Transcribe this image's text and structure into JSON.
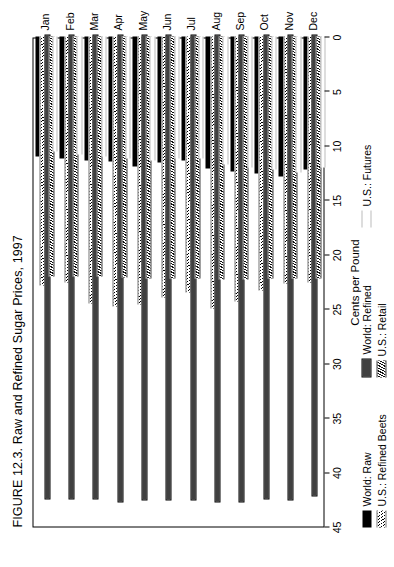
{
  "figure": {
    "title": "FIGURE 12.3. Raw and Refined Sugar Prices, 1997"
  },
  "axes": {
    "value_axis_title": "Cents per Pound",
    "value_ticks": [
      0,
      5,
      10,
      15,
      20,
      25,
      30,
      35,
      40,
      45
    ],
    "value_min": 0,
    "value_max": 45,
    "category_axis_title": ""
  },
  "legend": {
    "items": [
      {
        "label": "World: Raw",
        "pattern": "solid-black"
      },
      {
        "label": "World: Refined",
        "pattern": "checkerboard"
      },
      {
        "label": "U.S.: Futures",
        "pattern": "stipple-dots"
      },
      {
        "label": "U.S.: Refined Beets",
        "pattern": "light-diagonal-hatch"
      },
      {
        "label": "U.S.: Retail",
        "pattern": "dense-chevron-hatch"
      }
    ]
  },
  "chart_data": {
    "type": "bar",
    "orientation": "horizontal",
    "title": "FIGURE 12.3. Raw and Refined Sugar Prices, 1997",
    "xlabel": "Cents per Pound",
    "ylabel": "",
    "xlim": [
      0,
      45
    ],
    "xticks": [
      0,
      5,
      10,
      15,
      20,
      25,
      30,
      35,
      40,
      45
    ],
    "grid": false,
    "legend_position": "bottom",
    "categories": [
      "Jan",
      "Feb",
      "Mar",
      "Apr",
      "May",
      "Jun",
      "Jul",
      "Aug",
      "Sep",
      "Oct",
      "Nov",
      "Dec"
    ],
    "series": [
      {
        "name": "World: Raw",
        "pattern": "solid-black",
        "values": [
          11.0,
          11.2,
          11.4,
          11.5,
          11.9,
          11.6,
          11.4,
          12.1,
          12.4,
          12.6,
          12.9,
          12.2
        ]
      },
      {
        "name": "U.S.: Refined Beets",
        "pattern": "light-diagonal-hatch",
        "values": [
          22.9,
          22.6,
          24.5,
          24.8,
          24.6,
          24.0,
          23.5,
          25.0,
          24.3,
          23.3,
          22.7,
          22.6
        ]
      },
      {
        "name": "World: Refined",
        "pattern": "checkerboard",
        "values": [
          42.5,
          42.5,
          42.5,
          42.8,
          42.6,
          42.6,
          42.6,
          42.8,
          42.8,
          42.5,
          42.6,
          42.2
        ]
      },
      {
        "name": "U.S.: Retail",
        "pattern": "dense-chevron-hatch",
        "values": [
          22.0,
          22.0,
          22.0,
          22.1,
          22.2,
          22.2,
          22.2,
          22.3,
          22.3,
          22.2,
          22.2,
          22.2
        ]
      },
      {
        "name": "U.S.: Futures",
        "pattern": "stipple-dots",
        "values": [
          10.6,
          10.8,
          11.0,
          11.2,
          11.4,
          11.2,
          11.2,
          11.8,
          12.0,
          12.2,
          12.5,
          12.0
        ]
      }
    ]
  }
}
